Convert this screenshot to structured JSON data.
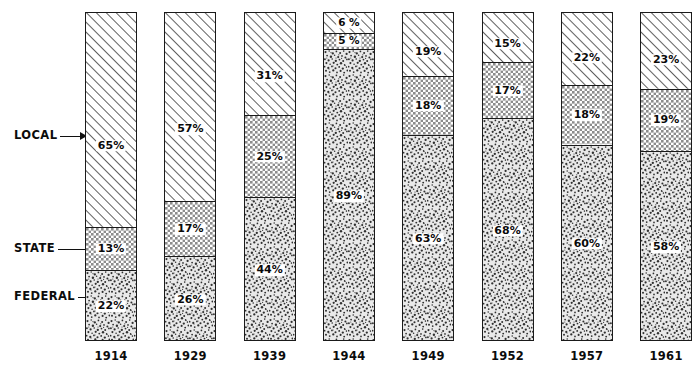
{
  "chart_data": {
    "type": "bar",
    "subtype": "stacked-bar-100-percent",
    "title": "",
    "subtitle": "",
    "xlabel": "",
    "ylabel": "",
    "ylim": [
      0,
      100
    ],
    "grid": false,
    "legend_position": "left-axis-labels",
    "categories": [
      "1914",
      "1929",
      "1939",
      "1944",
      "1949",
      "1952",
      "1957",
      "1961"
    ],
    "series": [
      {
        "name": "LOCAL",
        "pattern": "diagonal-hatch",
        "values": [
          65,
          57,
          31,
          6,
          19,
          15,
          22,
          23
        ],
        "value_labels": [
          "65%",
          "57%",
          "31%",
          "6 %",
          "19%",
          "15%",
          "22%",
          "23%"
        ]
      },
      {
        "name": "STATE",
        "pattern": "cross-hatch-grid",
        "values": [
          13,
          17,
          25,
          5,
          18,
          17,
          18,
          19
        ],
        "value_labels": [
          "13%",
          "17%",
          "25%",
          "5 %",
          "18%",
          "17%",
          "18%",
          "19%"
        ]
      },
      {
        "name": "FEDERAL",
        "pattern": "stipple-speckle",
        "values": [
          22,
          26,
          44,
          89,
          63,
          68,
          60,
          58
        ],
        "value_labels": [
          "22%",
          "26%",
          "44%",
          "89%",
          "63%",
          "68%",
          "60%",
          "58%"
        ]
      }
    ],
    "stack_order_top_to_bottom": [
      "LOCAL",
      "STATE",
      "FEDERAL"
    ],
    "colors": {
      "ink": "#1a1a1a",
      "background": "#ffffff",
      "label_text": "#0a0a0a"
    }
  },
  "axis": {
    "category_labels": [
      {
        "name": "LOCAL",
        "text": "LOCAL"
      },
      {
        "name": "STATE",
        "text": "STATE"
      },
      {
        "name": "FEDERAL",
        "text": "FEDERAL"
      }
    ],
    "year_labels": [
      "1914",
      "1929",
      "1939",
      "1944",
      "1949",
      "1952",
      "1957",
      "1961"
    ]
  }
}
